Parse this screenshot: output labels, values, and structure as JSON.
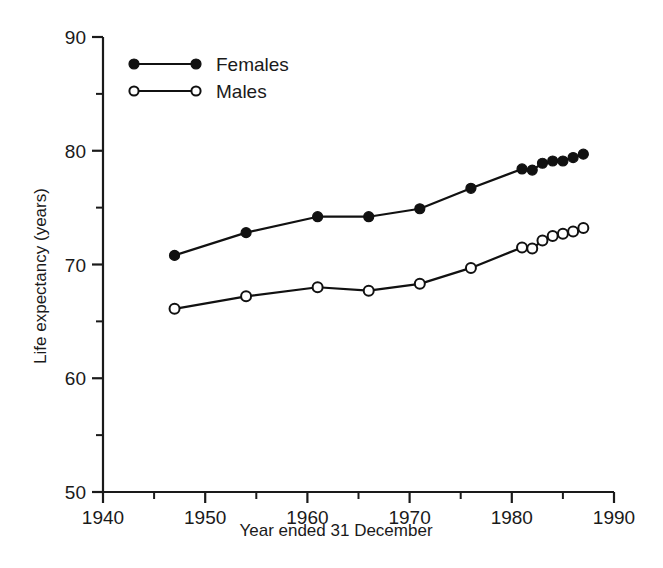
{
  "chart_data": {
    "type": "line",
    "title": "",
    "xlabel": "Year ended 31 December",
    "ylabel": "Life expectancy (years)",
    "xlim": [
      1940,
      1990
    ],
    "ylim": [
      50,
      90
    ],
    "grid": false,
    "legend_position": "top-left",
    "x_major_ticks": [
      1940,
      1950,
      1960,
      1970,
      1980,
      1990
    ],
    "x_major_tick_labels": [
      "1940",
      "1950",
      "1960",
      "1970",
      "1980",
      "1990"
    ],
    "x_minor_ticks": [
      1945,
      1955,
      1965,
      1975,
      1985
    ],
    "y_major_ticks": [
      50,
      60,
      70,
      80,
      90
    ],
    "y_major_tick_labels": [
      "50",
      "60",
      "70",
      "80",
      "90"
    ],
    "y_minor_ticks": [
      55,
      65,
      75,
      85
    ],
    "series": [
      {
        "name": "Females",
        "marker": "filled-circle",
        "color": "#111111",
        "x": [
          1947,
          1954,
          1961,
          1966,
          1971,
          1976,
          1981,
          1982,
          1983,
          1984,
          1985,
          1986,
          1987
        ],
        "values": [
          70.8,
          72.8,
          74.2,
          74.2,
          74.9,
          76.7,
          78.4,
          78.3,
          78.9,
          79.1,
          79.1,
          79.4,
          79.7
        ]
      },
      {
        "name": "Males",
        "marker": "open-circle",
        "color": "#111111",
        "x": [
          1947,
          1954,
          1961,
          1966,
          1971,
          1976,
          1981,
          1982,
          1983,
          1984,
          1985,
          1986,
          1987
        ],
        "values": [
          66.1,
          67.2,
          68.0,
          67.7,
          68.3,
          69.7,
          71.5,
          71.4,
          72.1,
          72.5,
          72.7,
          72.9,
          73.2
        ]
      }
    ]
  },
  "legend": {
    "entries": [
      {
        "label": "Females",
        "marker": "filled-circle"
      },
      {
        "label": "Males",
        "marker": "open-circle"
      }
    ]
  },
  "axes": {
    "x_title": "Year ended 31 December",
    "y_title": "Life expectancy (years)"
  }
}
